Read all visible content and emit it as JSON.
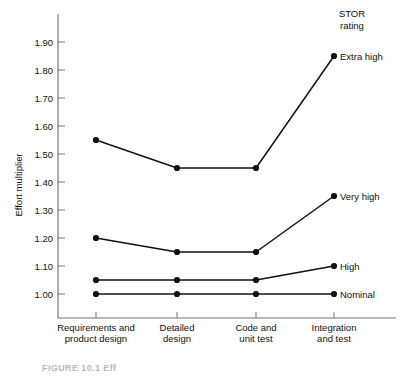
{
  "figure": {
    "caption": "FIGURE 10.1  Eff"
  },
  "chart_data": {
    "type": "line",
    "title": "",
    "xlabel": "",
    "ylabel": "Effort multiplier",
    "categories": [
      "Requirements and\nproduct design",
      "Detailed\ndesign",
      "Code and\nunit test",
      "Integration\nand test"
    ],
    "category_lines": [
      [
        "Requirements and",
        "product design"
      ],
      [
        "Detailed",
        "design"
      ],
      [
        "Code and",
        "unit test"
      ],
      [
        "Integration",
        "and test"
      ]
    ],
    "ylim": [
      0.955,
      1.945
    ],
    "yticks": [
      1.0,
      1.1,
      1.2,
      1.3,
      1.4,
      1.5,
      1.6,
      1.7,
      1.8,
      1.9
    ],
    "ytick_labels": [
      "1.00",
      "1.10",
      "1.20",
      "1.30",
      "1.40",
      "1.50",
      "1.60",
      "1.70",
      "1.80",
      "1.90"
    ],
    "grid": false,
    "legend_position": "right-inline",
    "legend_title_lines": [
      "STOR",
      "rating"
    ],
    "series": [
      {
        "name": "Extra high",
        "values": [
          1.55,
          1.45,
          1.45,
          1.85
        ],
        "color": "#111111"
      },
      {
        "name": "Very high",
        "values": [
          1.2,
          1.15,
          1.15,
          1.35
        ],
        "color": "#111111"
      },
      {
        "name": "High",
        "values": [
          1.05,
          1.05,
          1.05,
          1.1
        ],
        "color": "#111111"
      },
      {
        "name": "Nominal",
        "values": [
          1.0,
          1.0,
          1.0,
          1.0
        ],
        "color": "#111111"
      }
    ]
  }
}
